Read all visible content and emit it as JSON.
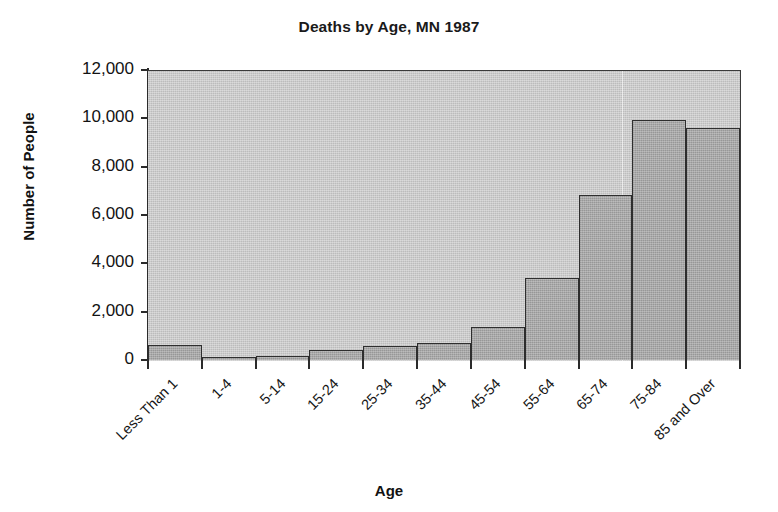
{
  "chart_data": {
    "type": "bar",
    "title": "Deaths by Age, MN 1987",
    "xlabel": "Age",
    "ylabel": "Number of People",
    "categories": [
      "Less Than 1",
      "1-4",
      "5-14",
      "15-24",
      "25-34",
      "35-44",
      "45-54",
      "55-64",
      "65-74",
      "75-84",
      "85 and Over"
    ],
    "values": [
      620,
      120,
      150,
      420,
      600,
      720,
      1350,
      3380,
      6830,
      9950,
      9600
    ],
    "ylim": [
      0,
      12000
    ],
    "ytick_labels": [
      "0",
      "2,000",
      "4,000",
      "6,000",
      "8,000",
      "10,000",
      "12,000"
    ],
    "ytick_values": [
      0,
      2000,
      4000,
      6000,
      8000,
      10000,
      12000
    ],
    "grid": false,
    "legend": "none",
    "colors": {
      "bar_fill": "#a8a8a8",
      "bar_edge": "#2e2e2e",
      "plot_background": "#bcbcbc",
      "axis": "#2b2b2b",
      "text": "#131313",
      "page_background": "#ffffff"
    }
  }
}
